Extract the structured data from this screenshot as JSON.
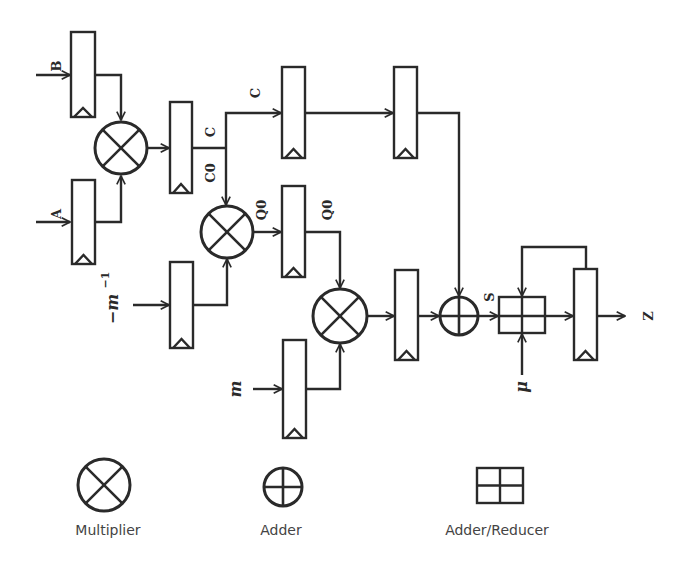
{
  "diagram": {
    "type": "datapath-block-diagram",
    "inputs": {
      "b": "B",
      "a": "A",
      "minus_m_inv": "−m",
      "minus_m_inv_sup": "−1",
      "m": "m",
      "mu": "μ"
    },
    "signals": {
      "c_top": "C",
      "c_junction": "C",
      "c0": "C0",
      "q0_left": "Q0",
      "q0_right": "Q0",
      "s": "S"
    },
    "output": "Z",
    "components": [
      {
        "id": "reg-b",
        "kind": "register",
        "input": "B"
      },
      {
        "id": "reg-a",
        "kind": "register",
        "input": "A"
      },
      {
        "id": "mult-1",
        "kind": "multiplier",
        "inputs": [
          "reg-b",
          "reg-a"
        ],
        "output": "C"
      },
      {
        "id": "reg-c",
        "kind": "register"
      },
      {
        "id": "reg-c-delay-1",
        "kind": "register",
        "input": "C"
      },
      {
        "id": "reg-c-delay-2",
        "kind": "register"
      },
      {
        "id": "reg-minv",
        "kind": "register",
        "input": "−m^−1"
      },
      {
        "id": "mult-2",
        "kind": "multiplier",
        "inputs": [
          "C0",
          "reg-minv"
        ],
        "output": "Q0"
      },
      {
        "id": "reg-q0",
        "kind": "register"
      },
      {
        "id": "reg-m",
        "kind": "register",
        "input": "m"
      },
      {
        "id": "mult-3",
        "kind": "multiplier",
        "inputs": [
          "Q0",
          "reg-m"
        ]
      },
      {
        "id": "reg-prod",
        "kind": "register"
      },
      {
        "id": "adder",
        "kind": "adder",
        "inputs": [
          "reg-prod",
          "reg-c-delay-2"
        ],
        "output": "S"
      },
      {
        "id": "adder-reducer",
        "kind": "adder-reducer",
        "inputs": [
          "S",
          "μ",
          "feedback"
        ]
      },
      {
        "id": "reg-out",
        "kind": "register",
        "output": "Z"
      }
    ]
  },
  "legend": {
    "multiplier": "Multiplier",
    "adder": "Adder",
    "adder_reducer": "Adder/Reducer"
  }
}
